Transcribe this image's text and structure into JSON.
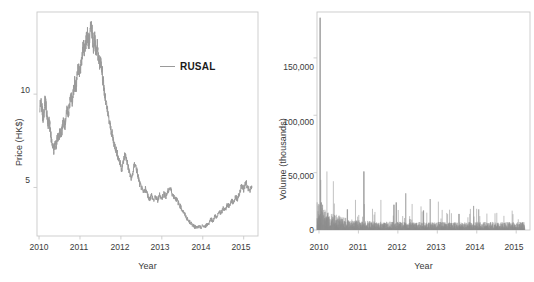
{
  "figure": {
    "background_color": "#ffffff",
    "panel_count": 2,
    "series_color": "#9a9a9a",
    "frame_color": "#c9c9c9",
    "text_color": "#3a3a3a"
  },
  "chart_data": [
    {
      "type": "line",
      "panel": "left",
      "title": "",
      "xlabel": "Year",
      "ylabel": "Price (HK$)",
      "xlim": [
        2009.95,
        2015.35
      ],
      "ylim": [
        2.4,
        14.4
      ],
      "xticks": [
        2010,
        2011,
        2012,
        2013,
        2014,
        2015
      ],
      "xticklabels": [
        "2010",
        "2011",
        "2012",
        "2013",
        "2014",
        "2015"
      ],
      "yticks": [
        5,
        10
      ],
      "yticklabels": [
        "5",
        "10"
      ],
      "grid": false,
      "legend": {
        "position": "top-right-inside",
        "entries": [
          {
            "label": "RUSAL",
            "color": "#9a9a9a",
            "marker": "line"
          }
        ]
      },
      "series": [
        {
          "name": "RUSAL",
          "color": "#9a9a9a",
          "x": [
            2010.02,
            2010.05,
            2010.08,
            2010.1,
            2010.12,
            2010.15,
            2010.17,
            2010.2,
            2010.22,
            2010.25,
            2010.27,
            2010.3,
            2010.33,
            2010.36,
            2010.39,
            2010.42,
            2010.45,
            2010.48,
            2010.51,
            2010.54,
            2010.57,
            2010.6,
            2010.63,
            2010.66,
            2010.69,
            2010.72,
            2010.75,
            2010.78,
            2010.81,
            2010.84,
            2010.87,
            2010.9,
            2010.93,
            2010.96,
            2011.0,
            2011.03,
            2011.06,
            2011.09,
            2011.12,
            2011.15,
            2011.18,
            2011.21,
            2011.24,
            2011.27,
            2011.3,
            2011.33,
            2011.36,
            2011.39,
            2011.42,
            2011.45,
            2011.48,
            2011.51,
            2011.55,
            2011.58,
            2011.62,
            2011.66,
            2011.7,
            2011.74,
            2011.78,
            2011.82,
            2011.86,
            2011.9,
            2011.94,
            2011.98,
            2012.02,
            2012.06,
            2012.1,
            2012.14,
            2012.18,
            2012.22,
            2012.26,
            2012.3,
            2012.34,
            2012.38,
            2012.42,
            2012.46,
            2012.5,
            2012.55,
            2012.6,
            2012.65,
            2012.7,
            2012.75,
            2012.8,
            2012.85,
            2012.9,
            2012.95,
            2013.0,
            2013.05,
            2013.1,
            2013.15,
            2013.2,
            2013.25,
            2013.3,
            2013.35,
            2013.4,
            2013.45,
            2013.5,
            2013.55,
            2013.6,
            2013.65,
            2013.7,
            2013.75,
            2013.8,
            2013.85,
            2013.9,
            2013.95,
            2014.0,
            2014.05,
            2014.1,
            2014.15,
            2014.2,
            2014.25,
            2014.3,
            2014.35,
            2014.4,
            2014.45,
            2014.5,
            2014.55,
            2014.6,
            2014.65,
            2014.7,
            2014.75,
            2014.8,
            2014.85,
            2014.9,
            2014.95,
            2015.0,
            2015.05,
            2015.1,
            2015.15,
            2015.2
          ],
          "y": [
            9.3,
            9.6,
            9.1,
            8.6,
            9.0,
            9.8,
            9.3,
            8.7,
            8.3,
            8.6,
            8.1,
            7.6,
            7.3,
            7.0,
            7.4,
            7.2,
            7.8,
            7.6,
            8.0,
            7.7,
            8.2,
            8.6,
            8.3,
            8.8,
            9.2,
            9.0,
            9.5,
            9.9,
            9.6,
            10.1,
            10.6,
            10.3,
            11.0,
            11.4,
            11.1,
            11.8,
            12.2,
            12.6,
            12.3,
            12.9,
            13.3,
            12.7,
            13.0,
            13.8,
            13.2,
            12.6,
            12.9,
            12.2,
            12.6,
            12.0,
            11.6,
            11.9,
            11.0,
            10.4,
            9.7,
            9.2,
            8.7,
            8.3,
            7.9,
            7.5,
            7.2,
            6.9,
            6.6,
            6.3,
            6.0,
            6.4,
            6.8,
            6.5,
            6.1,
            5.7,
            5.4,
            5.9,
            6.3,
            6.0,
            5.6,
            5.2,
            5.0,
            4.7,
            4.9,
            4.6,
            4.4,
            4.6,
            4.3,
            4.5,
            4.3,
            4.6,
            4.4,
            4.7,
            4.5,
            4.8,
            5.0,
            4.7,
            4.5,
            4.4,
            4.2,
            4.0,
            3.8,
            3.6,
            3.4,
            3.2,
            3.1,
            3.0,
            2.9,
            2.85,
            2.9,
            2.85,
            2.95,
            2.9,
            3.0,
            3.1,
            3.3,
            3.2,
            3.5,
            3.4,
            3.7,
            3.6,
            3.9,
            3.8,
            4.1,
            4.0,
            4.3,
            4.2,
            4.5,
            4.4,
            4.7,
            5.1,
            4.9,
            5.3,
            5.0,
            4.8,
            5.0,
            5.4,
            5.2
          ]
        }
      ]
    },
    {
      "type": "bar",
      "panel": "right",
      "title": "",
      "xlabel": "Year",
      "ylabel": "Volume (thousands)",
      "xlim": [
        2009.95,
        2015.35
      ],
      "ylim": [
        0,
        190000
      ],
      "xticks": [
        2010,
        2011,
        2012,
        2013,
        2014,
        2015
      ],
      "xticklabels": [
        "2010",
        "2011",
        "2012",
        "2013",
        "2014",
        "2015"
      ],
      "yticks": [
        0,
        50000,
        100000,
        150000
      ],
      "yticklabels": [
        "0",
        "50,000",
        "100,000",
        "150,000"
      ],
      "grid": false,
      "bar_color": "#8e8e8e",
      "peak_value": 185000,
      "peak_x": 2010.03,
      "notable_spikes": [
        {
          "x": 2010.03,
          "value": 185000
        },
        {
          "x": 2010.06,
          "value": 24000
        },
        {
          "x": 2010.09,
          "value": 22000
        },
        {
          "x": 2010.72,
          "value": 18000
        },
        {
          "x": 2011.14,
          "value": 51000
        },
        {
          "x": 2011.9,
          "value": 22000
        },
        {
          "x": 2011.96,
          "value": 24000
        },
        {
          "x": 2012.2,
          "value": 32000
        },
        {
          "x": 2012.65,
          "value": 17000
        },
        {
          "x": 2012.82,
          "value": 27000
        },
        {
          "x": 2013.55,
          "value": 14000
        },
        {
          "x": 2013.92,
          "value": 21000
        },
        {
          "x": 2014.05,
          "value": 18000
        }
      ],
      "baseline_typical": 4000
    }
  ],
  "panels": {
    "left": {
      "name": "price-panel",
      "xlabel": "Year",
      "ylabel": "Price (HK$)",
      "xticklabels": [
        "2010",
        "2011",
        "2012",
        "2013",
        "2014",
        "2015"
      ],
      "yticklabels": [
        "10",
        "5"
      ],
      "legend_label": "RUSAL"
    },
    "right": {
      "name": "volume-panel",
      "xlabel": "Year",
      "ylabel": "Volume (thousands)",
      "xticklabels": [
        "2010",
        "2011",
        "2012",
        "2013",
        "2014",
        "2015"
      ],
      "yticklabels": [
        "150,000",
        "100,000",
        "50,000",
        "0"
      ]
    }
  }
}
